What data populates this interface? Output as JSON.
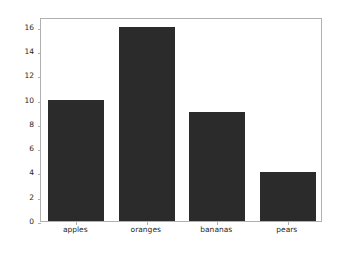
{
  "chart_data": {
    "type": "bar",
    "title": "",
    "xlabel": "",
    "ylabel": "",
    "categories": [
      "apples",
      "oranges",
      "bananas",
      "pears"
    ],
    "values": [
      10,
      16,
      9,
      4
    ],
    "yticks": [
      0,
      2,
      4,
      6,
      8,
      10,
      12,
      14,
      16
    ],
    "ytick_labels": [
      "0",
      "2",
      "4",
      "6",
      "8",
      "10",
      "12",
      "14",
      "16"
    ],
    "ylim": [
      0,
      16.8
    ],
    "grid": false,
    "legend": null,
    "bar_color": "#2b2b2b",
    "background_color": "#ffffff",
    "spine_color": "#b0b0b0",
    "tick_label_color": "#262626",
    "bar_width_fraction": 0.8
  }
}
